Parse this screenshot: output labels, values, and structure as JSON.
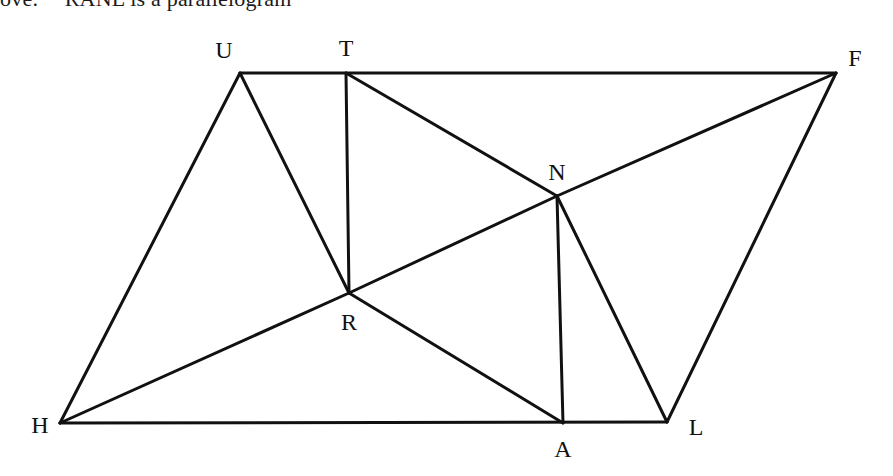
{
  "caption": {
    "lead": "ove:",
    "text": "RANL is a parallelogram"
  },
  "figure": {
    "stroke_color": "#111111",
    "background": "#ffffff",
    "vertices": [
      {
        "id": "U",
        "x": 240,
        "y": 73,
        "label_x": 224,
        "label_y": 50
      },
      {
        "id": "T",
        "x": 346,
        "y": 73,
        "label_x": 346,
        "label_y": 48
      },
      {
        "id": "F",
        "x": 836,
        "y": 73,
        "label_x": 855,
        "label_y": 58
      },
      {
        "id": "N",
        "x": 557,
        "y": 196,
        "label_x": 557,
        "label_y": 172
      },
      {
        "id": "R",
        "x": 349,
        "y": 293,
        "label_x": 349,
        "label_y": 322
      },
      {
        "id": "H",
        "x": 60,
        "y": 423,
        "label_x": 40,
        "label_y": 425
      },
      {
        "id": "A",
        "x": 563,
        "y": 423,
        "label_x": 563,
        "label_y": 449
      },
      {
        "id": "L",
        "x": 667,
        "y": 422,
        "label_x": 696,
        "label_y": 427
      }
    ],
    "edges": [
      [
        "U",
        "F"
      ],
      [
        "U",
        "H"
      ],
      [
        "U",
        "R"
      ],
      [
        "T",
        "R"
      ],
      [
        "T",
        "N"
      ],
      [
        "H",
        "R"
      ],
      [
        "R",
        "N"
      ],
      [
        "N",
        "F"
      ],
      [
        "H",
        "L"
      ],
      [
        "R",
        "A"
      ],
      [
        "N",
        "A"
      ],
      [
        "N",
        "L"
      ],
      [
        "F",
        "L"
      ]
    ],
    "labels": {
      "U": "U",
      "T": "T",
      "F": "F",
      "N": "N",
      "R": "R",
      "H": "H",
      "A": "A",
      "L": "L"
    }
  }
}
